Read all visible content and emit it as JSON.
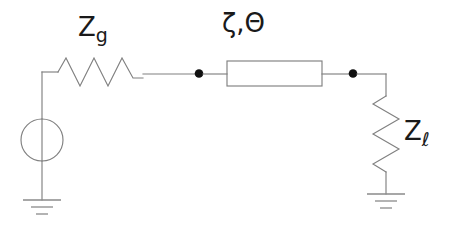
{
  "diagram": {
    "type": "electrical-schematic",
    "background_color": "#ffffff",
    "wire_color": "#808080",
    "label_color": "#1a1a1a",
    "node_color": "#101010"
  },
  "labels": {
    "source_impedance": {
      "base": "Z",
      "subscript": "g",
      "full": "Zg"
    },
    "transmission_line": {
      "text": "ζ,Θ",
      "zeta": "ζ",
      "comma": ",",
      "theta": "Θ"
    },
    "load_impedance": {
      "base": "Z",
      "subscript": "ℓ",
      "full": "Zℓ"
    }
  },
  "components": [
    {
      "name": "voltage-source",
      "symbol": "circle",
      "center_x": 42,
      "center_y": 140,
      "radius": 21
    },
    {
      "name": "source-resistor",
      "symbol": "zigzag-horizontal",
      "label": "Zg"
    },
    {
      "name": "transmission-line-box",
      "symbol": "rectangle",
      "label": "ζ,Θ"
    },
    {
      "name": "load-resistor",
      "symbol": "zigzag-vertical",
      "label": "Zℓ"
    },
    {
      "name": "ground-left",
      "symbol": "ground-3-bar"
    },
    {
      "name": "ground-right",
      "symbol": "ground-3-bar"
    },
    {
      "name": "node-left",
      "symbol": "filled-dot"
    },
    {
      "name": "node-right",
      "symbol": "filled-dot"
    }
  ]
}
